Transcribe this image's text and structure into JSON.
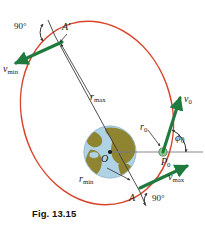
{
  "figure": {
    "caption": "Fig. 13.15",
    "colors": {
      "orbit": "#d8442a",
      "velocity_vector": "#1f7a3d",
      "axis_line": "#3a3a3a",
      "reference_line": "#7a7a7a",
      "ocean": "#afd2e4",
      "land": "#8f8430",
      "point_marker": "#8fc98f",
      "text": "#1a1a1a"
    }
  },
  "labels": {
    "angle_apogee": "90°",
    "apogee_point": "A′",
    "v_min_base": "v",
    "v_min_sub": "min",
    "r_max_base": "r",
    "r_max_sub": "max",
    "r_min_base": "r",
    "r_min_sub": "min",
    "center_point": "O",
    "r0_base": "r",
    "r0_sub": "0",
    "v0_base": "v",
    "v0_sub": "0",
    "phi0_base": "ϕ",
    "phi0_sub": "0",
    "p0_base": "P",
    "p0_sub": "0",
    "v_max_base": "v",
    "v_max_sub": "max",
    "perigee_point": "A",
    "angle_perigee": "90°"
  }
}
